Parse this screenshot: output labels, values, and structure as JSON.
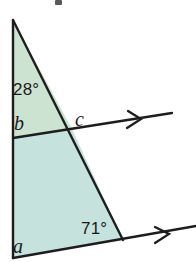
{
  "figure": {
    "canvas": {
      "width": 196,
      "height": 262,
      "background": "#ffffff"
    },
    "colors": {
      "fill_upper": "#cde3d2",
      "fill_lower": "#c6e2dd",
      "stroke": "#1d1d1d",
      "label_text": "#1a1a1a"
    },
    "labels": {
      "angle_top": "28°",
      "angle_b": "b",
      "angle_c": "c",
      "angle_bottom": "71°",
      "angle_a": "a"
    },
    "geometry": {
      "apex": [
        13,
        20
      ],
      "left_base": [
        13,
        258
      ],
      "right_base": [
        123,
        240
      ],
      "transversal_left": [
        13,
        138
      ],
      "transversal_intersection": [
        72,
        129
      ],
      "transversal_right_end": [
        172,
        113
      ],
      "transversal_arrow_at": [
        135,
        120
      ],
      "baseline_right_end": [
        196,
        228
      ],
      "baseline_arrow_at": [
        163,
        235
      ]
    },
    "arrows": [
      {
        "name": "upper-parallel-arrowhead",
        "glyph": "chevron-right"
      },
      {
        "name": "lower-parallel-arrowhead",
        "glyph": "chevron-right"
      }
    ]
  }
}
